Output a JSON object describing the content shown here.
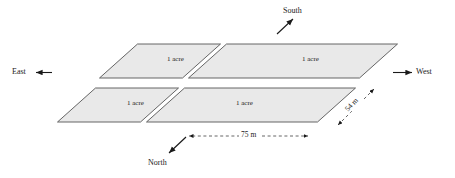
{
  "diagram": {
    "plots": [
      {
        "id": "top-left",
        "label": "1 acre"
      },
      {
        "id": "top-right",
        "label": "1 acre"
      },
      {
        "id": "bottom-left",
        "label": "1 acre"
      },
      {
        "id": "bottom-right",
        "label": "1 acre"
      }
    ],
    "directions": [
      {
        "id": "south",
        "label": "South",
        "arrow": "up-right"
      },
      {
        "id": "north",
        "label": "North",
        "arrow": "down-left"
      },
      {
        "id": "east",
        "label": "East",
        "arrow": "left"
      },
      {
        "id": "west",
        "label": "West",
        "arrow": "right"
      }
    ],
    "dimensions": [
      {
        "id": "width",
        "label": "75 m",
        "orientation": "horizontal"
      },
      {
        "id": "depth",
        "label": "54 m",
        "orientation": "diagonal"
      }
    ],
    "colors": {
      "fill": "#e9e9e9",
      "stroke": "#555555",
      "text": "#1a1a1a",
      "dash": "#555555"
    }
  }
}
